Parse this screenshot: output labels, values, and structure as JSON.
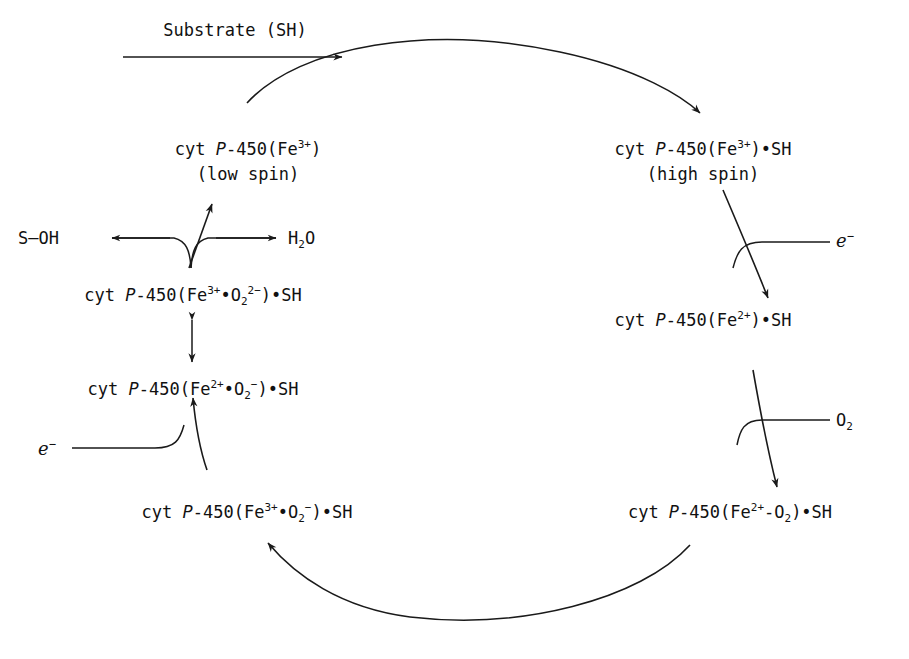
{
  "diagram": {
    "stroke_color": "#1a1a1a",
    "background_color": "#ffffff",
    "inputs": {
      "substrate_label": "Substrate (SH)",
      "electron_right_label": "e",
      "electron_right_charge": "−",
      "oxygen_label": "O",
      "oxygen_subscript": "2",
      "electron_left_label": "e",
      "electron_left_charge": "−"
    },
    "products": {
      "product_label": "S—OH",
      "water_label": "H",
      "water_subscript": "2",
      "water_tail": "O"
    },
    "species": [
      {
        "id": "ferric-low-spin",
        "prefix": "cyt ",
        "italic": "P",
        "core": "-450(Fe",
        "sup": "3+",
        "suffix": ")",
        "spin": "(low spin)"
      },
      {
        "id": "ferric-substrate-high-spin",
        "prefix": "cyt ",
        "italic": "P",
        "core": "-450(Fe",
        "sup": "3+",
        "suffix": ")•SH",
        "spin": "(high spin)"
      },
      {
        "id": "ferrous-substrate",
        "prefix": "cyt ",
        "italic": "P",
        "core": "-450(Fe",
        "sup": "2+",
        "suffix": ")•SH",
        "spin": ""
      },
      {
        "id": "ferrous-dioxygen",
        "prefix": "cyt ",
        "italic": "P",
        "core": "-450(Fe",
        "sup": "2+",
        "mid": "-O",
        "midsub": "2",
        "suffix": ")•SH",
        "spin": ""
      },
      {
        "id": "ferric-superoxide",
        "prefix": "cyt ",
        "italic": "P",
        "core": "-450(Fe",
        "sup": "3+",
        "mid": "•O",
        "midsub": "2",
        "midsup": "−",
        "suffix": ")•SH",
        "spin": ""
      },
      {
        "id": "ferrous-superoxide",
        "prefix": "cyt ",
        "italic": "P",
        "core": "-450(Fe",
        "sup": "2+",
        "mid": "•O",
        "midsub": "2",
        "midsup": "−",
        "suffix": ")•SH",
        "spin": ""
      },
      {
        "id": "ferric-peroxide",
        "prefix": "cyt ",
        "italic": "P",
        "core": "-450(Fe",
        "sup": "3+",
        "mid": "•O",
        "midsub": "2",
        "midsup": "2−",
        "suffix": ")•SH",
        "spin": ""
      }
    ]
  }
}
